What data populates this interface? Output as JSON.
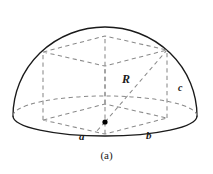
{
  "figure": {
    "caption": "(a)",
    "labels": {
      "radius": "R",
      "side_a": "a",
      "side_b": "b",
      "side_c": "c"
    },
    "colors": {
      "outline": "#1a1a1a",
      "dashed": "#7a7a7a",
      "point": "#000000",
      "background": "#ffffff"
    }
  },
  "geometry": {
    "description": "Hemispherical dome with an inscribed rectangular box",
    "dome": {
      "center_x": 105,
      "base_y": 116,
      "radius_x": 92,
      "radius_y": 89,
      "base_ellipse_ry": 19
    },
    "box": {
      "front_left_bottom": [
        43,
        120
      ],
      "front_right_bottom": [
        167,
        118
      ],
      "front_left_top": [
        43,
        52
      ],
      "front_right_top": [
        167,
        50
      ],
      "back_left_bottom": [
        67,
        104
      ],
      "back_right_bottom": [
        143,
        103
      ],
      "back_left_top": [
        67,
        39
      ],
      "back_right_top": [
        143,
        38
      ]
    },
    "center_point": [
      105,
      122
    ],
    "radius_line": {
      "from": [
        105,
        122
      ],
      "to": [
        167,
        50
      ]
    }
  }
}
